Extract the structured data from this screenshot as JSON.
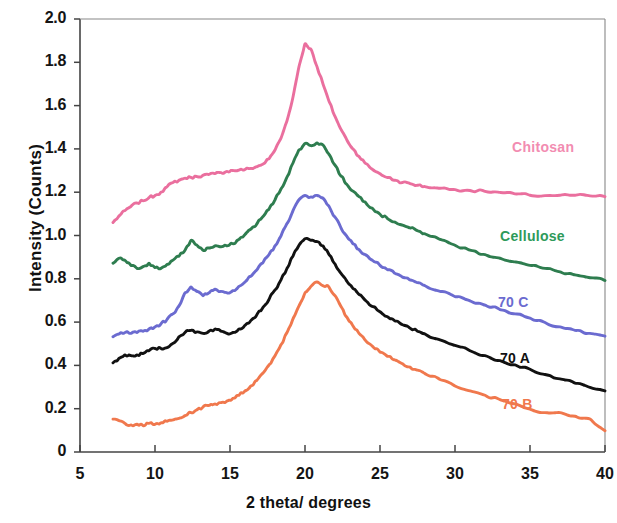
{
  "chart_data": {
    "type": "line",
    "title": "",
    "xlabel": "2 theta/ degrees",
    "ylabel": "Intensity (Counts)",
    "xlim": [
      5,
      40
    ],
    "ylim": [
      0,
      2.0
    ],
    "xticks": [
      "5",
      "10",
      "15",
      "20",
      "25",
      "30",
      "35",
      "40"
    ],
    "yticks": [
      "2.0",
      "1.8",
      "1.6",
      "1.4",
      "1.2",
      "1.0",
      "0.8",
      "0.6",
      "0.4",
      "0.2",
      "0"
    ],
    "grid": false,
    "legend_position": "inline-right",
    "x": [
      7.2,
      7.6,
      8.0,
      8.4,
      8.8,
      9.2,
      9.6,
      10.0,
      10.4,
      10.8,
      11.2,
      11.6,
      12.0,
      12.4,
      12.8,
      13.2,
      13.6,
      14.0,
      14.4,
      14.8,
      15.2,
      15.6,
      16.0,
      16.4,
      16.8,
      17.2,
      17.6,
      18.0,
      18.4,
      18.8,
      19.2,
      19.6,
      20.0,
      20.4,
      20.8,
      21.2,
      21.6,
      22.0,
      22.4,
      22.8,
      23.2,
      23.6,
      24.0,
      24.5,
      25.0,
      25.5,
      26.0,
      26.5,
      27.0,
      27.5,
      28.0,
      29.0,
      30.0,
      31.0,
      32.0,
      33.0,
      34.0,
      35.0,
      36.0,
      37.0,
      38.0,
      39.0,
      40.0
    ],
    "series": [
      {
        "name": "Chitosan",
        "color": "#ea6f9e",
        "label_color": "#f28cb1",
        "label_x": 512,
        "label_y": 139,
        "values": [
          1.06,
          1.09,
          1.115,
          1.135,
          1.15,
          1.16,
          1.175,
          1.185,
          1.2,
          1.225,
          1.245,
          1.255,
          1.265,
          1.268,
          1.272,
          1.278,
          1.282,
          1.286,
          1.29,
          1.296,
          1.3,
          1.302,
          1.305,
          1.31,
          1.318,
          1.33,
          1.355,
          1.395,
          1.45,
          1.53,
          1.64,
          1.78,
          1.885,
          1.86,
          1.78,
          1.7,
          1.62,
          1.55,
          1.49,
          1.44,
          1.4,
          1.365,
          1.335,
          1.305,
          1.285,
          1.268,
          1.255,
          1.245,
          1.24,
          1.232,
          1.226,
          1.218,
          1.212,
          1.208,
          1.204,
          1.199,
          1.192,
          1.186,
          1.184,
          1.186,
          1.186,
          1.183,
          1.179
        ]
      },
      {
        "name": "Cellulose",
        "color": "#2e7d4f",
        "label_color": "#2e9a5a",
        "label_x": 500,
        "label_y": 228,
        "values": [
          0.872,
          0.895,
          0.885,
          0.862,
          0.848,
          0.856,
          0.872,
          0.852,
          0.848,
          0.866,
          0.886,
          0.905,
          0.932,
          0.978,
          0.955,
          0.932,
          0.942,
          0.952,
          0.948,
          0.952,
          0.962,
          0.982,
          1.005,
          1.03,
          1.055,
          1.088,
          1.122,
          1.165,
          1.215,
          1.27,
          1.335,
          1.395,
          1.425,
          1.415,
          1.428,
          1.418,
          1.375,
          1.325,
          1.275,
          1.235,
          1.205,
          1.18,
          1.155,
          1.125,
          1.098,
          1.078,
          1.062,
          1.048,
          1.035,
          1.022,
          1.008,
          0.982,
          0.955,
          0.932,
          0.912,
          0.895,
          0.878,
          0.862,
          0.848,
          0.832,
          0.818,
          0.805,
          0.792
        ]
      },
      {
        "name": "70 C",
        "color": "#6b6bd0",
        "label_color": "#6b6bd0",
        "label_x": 498,
        "label_y": 294,
        "values": [
          0.532,
          0.545,
          0.552,
          0.548,
          0.552,
          0.558,
          0.568,
          0.578,
          0.592,
          0.612,
          0.638,
          0.675,
          0.735,
          0.762,
          0.742,
          0.722,
          0.735,
          0.752,
          0.742,
          0.735,
          0.745,
          0.765,
          0.785,
          0.812,
          0.842,
          0.875,
          0.912,
          0.952,
          0.998,
          1.055,
          1.115,
          1.165,
          1.185,
          1.178,
          1.185,
          1.172,
          1.135,
          1.085,
          1.035,
          0.995,
          0.962,
          0.935,
          0.912,
          0.885,
          0.862,
          0.842,
          0.825,
          0.808,
          0.795,
          0.782,
          0.768,
          0.742,
          0.718,
          0.698,
          0.678,
          0.658,
          0.638,
          0.618,
          0.598,
          0.578,
          0.562,
          0.548,
          0.535
        ]
      },
      {
        "name": "70 A",
        "color": "#111111",
        "label_color": "#111111",
        "label_x": 500,
        "label_y": 350,
        "values": [
          0.412,
          0.432,
          0.448,
          0.445,
          0.448,
          0.455,
          0.468,
          0.478,
          0.478,
          0.482,
          0.502,
          0.532,
          0.552,
          0.562,
          0.555,
          0.548,
          0.558,
          0.568,
          0.558,
          0.548,
          0.552,
          0.568,
          0.585,
          0.608,
          0.635,
          0.668,
          0.705,
          0.748,
          0.795,
          0.848,
          0.905,
          0.955,
          0.985,
          0.978,
          0.972,
          0.952,
          0.912,
          0.868,
          0.825,
          0.788,
          0.755,
          0.728,
          0.702,
          0.672,
          0.648,
          0.625,
          0.605,
          0.588,
          0.572,
          0.558,
          0.545,
          0.518,
          0.492,
          0.468,
          0.445,
          0.422,
          0.402,
          0.382,
          0.358,
          0.338,
          0.318,
          0.298,
          0.282
        ]
      },
      {
        "name": "70 B",
        "color": "#f0784d",
        "label_color": "#f0784d",
        "label_x": 502,
        "label_y": 396,
        "values": [
          0.152,
          0.145,
          0.132,
          0.125,
          0.128,
          0.122,
          0.132,
          0.128,
          0.135,
          0.142,
          0.148,
          0.155,
          0.168,
          0.182,
          0.195,
          0.208,
          0.215,
          0.222,
          0.228,
          0.235,
          0.248,
          0.262,
          0.282,
          0.305,
          0.332,
          0.365,
          0.402,
          0.445,
          0.495,
          0.552,
          0.615,
          0.675,
          0.735,
          0.765,
          0.785,
          0.768,
          0.762,
          0.722,
          0.672,
          0.622,
          0.582,
          0.548,
          0.518,
          0.488,
          0.462,
          0.442,
          0.425,
          0.408,
          0.392,
          0.378,
          0.362,
          0.335,
          0.305,
          0.282,
          0.262,
          0.242,
          0.222,
          0.198,
          0.182,
          0.182,
          0.165,
          0.152,
          0.098
        ]
      }
    ]
  },
  "axes": {
    "x_pixel_min": 80,
    "x_pixel_max": 605,
    "y_pixel_min": 452,
    "y_pixel_max": 19
  }
}
